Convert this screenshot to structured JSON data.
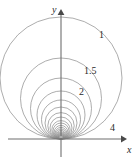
{
  "figure": {
    "kind": "math-diagram",
    "width": 139,
    "height": 166,
    "background_color": "#ffffff",
    "curve_color": "#8a8a8a",
    "axis_color": "#6f6f6f",
    "label_color": "#2b2b2b"
  },
  "axes": {
    "x_axis": {
      "label": "x",
      "label_x": 127,
      "label_y": 145,
      "y": 139,
      "x_start": 8,
      "x_end": 122,
      "arrow": "right"
    },
    "y_axis": {
      "label": "y",
      "label_x": 52,
      "label_y": 5,
      "x": 61,
      "y_start": 157,
      "y_end": 14,
      "arrow": "up"
    },
    "origin": {
      "x": 61,
      "y": 139
    }
  },
  "chart_data": {
    "type": "line",
    "title": "",
    "xlabel": "x",
    "ylabel": "y",
    "grid": false,
    "legend": "none",
    "note": "Each curve is a circle tangent to the x-axis at the origin; the label is the level value c. Larger c corresponds to a smaller circle.",
    "labeled_levels": [
      {
        "label": "1",
        "label_x": 99,
        "label_y": 30,
        "center_x": 61,
        "center_y": 78,
        "radius": 61
      },
      {
        "label": "1.5",
        "label_x": 84,
        "label_y": 66,
        "center_x": 61,
        "center_y": 98.5,
        "radius": 40.5
      },
      {
        "label": "2",
        "label_x": 79,
        "label_y": 87,
        "center_x": 61,
        "center_y": 108.5,
        "radius": 30.5
      },
      {
        "label": "4",
        "label_x": 110,
        "label_y": 123,
        "center_x": 61,
        "center_y": 131,
        "radius": 8
      }
    ],
    "circles": [
      {
        "center_x": 61,
        "center_y": 78,
        "radius": 61
      },
      {
        "center_x": 61,
        "center_y": 98.5,
        "radius": 40.5
      },
      {
        "center_x": 61,
        "center_y": 108.5,
        "radius": 30.5
      },
      {
        "center_x": 61,
        "center_y": 115,
        "radius": 24
      },
      {
        "center_x": 61,
        "center_y": 119.5,
        "radius": 19.5
      },
      {
        "center_x": 61,
        "center_y": 123,
        "radius": 16
      },
      {
        "center_x": 61,
        "center_y": 125.8,
        "radius": 13.2
      },
      {
        "center_x": 61,
        "center_y": 128,
        "radius": 11
      },
      {
        "center_x": 61,
        "center_y": 129.8,
        "radius": 9.2
      },
      {
        "center_x": 61,
        "center_y": 131,
        "radius": 8
      },
      {
        "center_x": 61,
        "center_y": 132.2,
        "radius": 6.8
      },
      {
        "center_x": 61,
        "center_y": 133.2,
        "radius": 5.8
      },
      {
        "center_x": 61,
        "center_y": 134,
        "radius": 5
      },
      {
        "center_x": 61,
        "center_y": 134.7,
        "radius": 4.3
      },
      {
        "center_x": 61,
        "center_y": 135.3,
        "radius": 3.7
      },
      {
        "center_x": 61,
        "center_y": 135.8,
        "radius": 3.2
      },
      {
        "center_x": 61,
        "center_y": 136.2,
        "radius": 2.8
      },
      {
        "center_x": 61,
        "center_y": 136.6,
        "radius": 2.4
      },
      {
        "center_x": 61,
        "center_y": 136.9,
        "radius": 2.1
      },
      {
        "center_x": 61,
        "center_y": 137.2,
        "radius": 1.8
      }
    ]
  }
}
